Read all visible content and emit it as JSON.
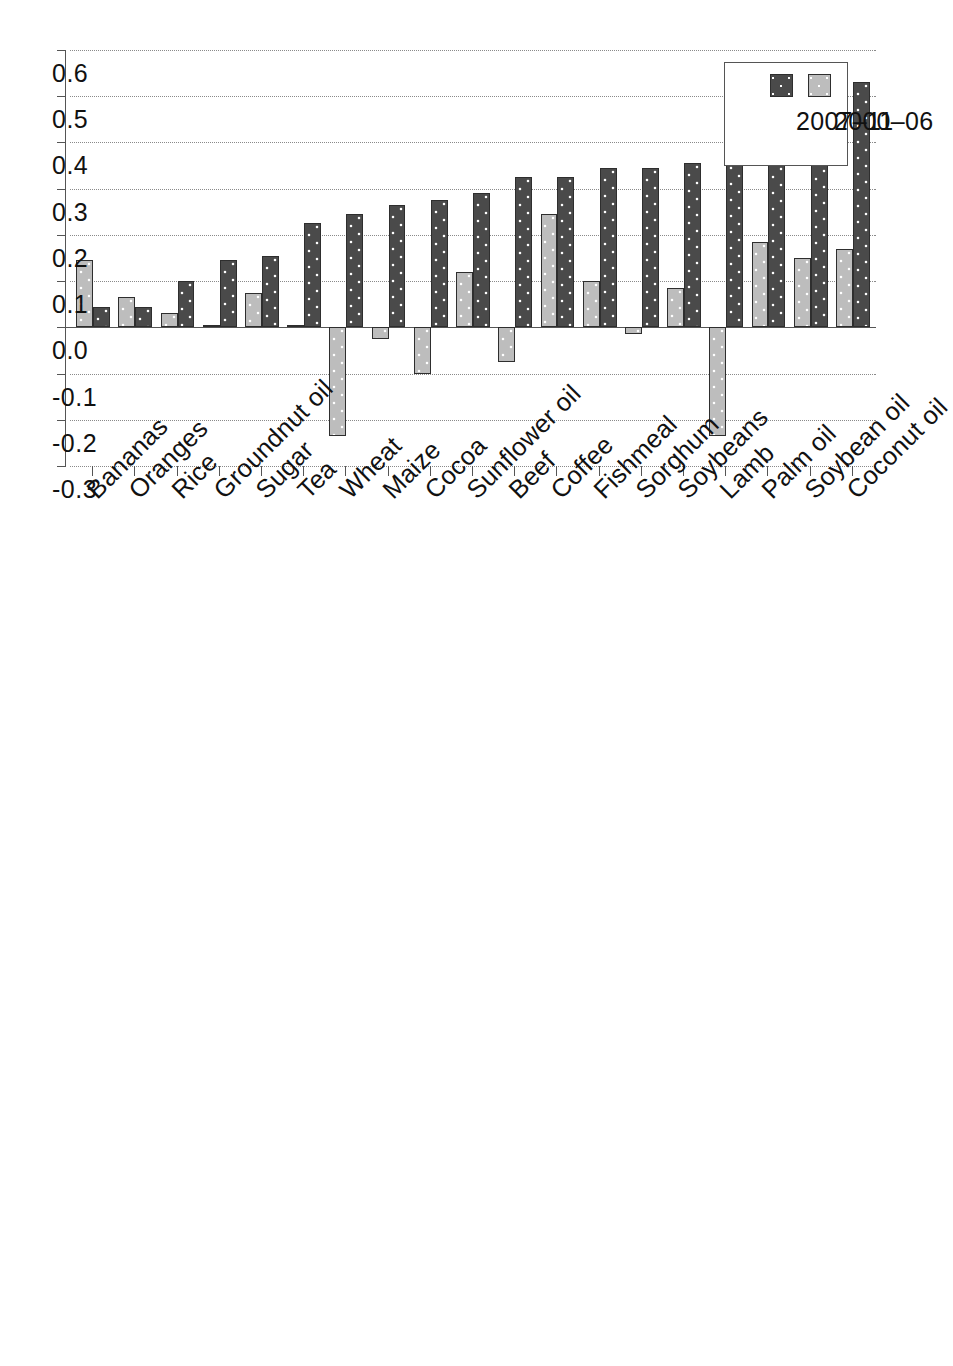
{
  "chart_data": {
    "type": "bar",
    "orientation": "horizontal-rotated",
    "title": "",
    "subtitle": "",
    "xlabel": "",
    "ylabel": "",
    "grid": true,
    "value_axis_range": [
      0.6,
      -0.3
    ],
    "value_axis_ticks": [
      "0.6",
      "0.5",
      "0.4",
      "0.3",
      "0.2",
      "0.1",
      "0.0",
      "-0.1",
      "-0.2",
      "-0.3"
    ],
    "value_axis_tick_values": [
      0.6,
      0.5,
      0.4,
      0.3,
      0.2,
      0.1,
      0.0,
      -0.1,
      -0.2,
      -0.3
    ],
    "legend_position": "top-left",
    "categories": [
      "Coconut oil",
      "Soybean oil",
      "Palm oil",
      "Lamb",
      "Soybeans",
      "Sorghum",
      "Fishmeal",
      "Coffee",
      "Beef",
      "Sunflower oil",
      "Cocoa",
      "Maize",
      "Wheat",
      "Tea",
      "Sugar",
      "Groundnut oil",
      "Rice",
      "Oranges",
      "Bananas"
    ],
    "series": [
      {
        "name": "2000–06",
        "color": "#bdbdbd",
        "values": [
          0.17,
          0.15,
          0.185,
          -0.235,
          0.085,
          -0.015,
          0.1,
          0.245,
          -0.075,
          0.12,
          -0.1,
          -0.025,
          -0.235,
          0.005,
          0.075,
          0.005,
          0.03,
          0.065,
          0.145
        ]
      },
      {
        "name": "2007–11",
        "color": "#4a4a4a",
        "values": [
          0.53,
          0.45,
          0.455,
          0.405,
          0.355,
          0.345,
          0.345,
          0.325,
          0.325,
          0.29,
          0.275,
          0.265,
          0.245,
          0.225,
          0.155,
          0.145,
          0.1,
          0.045,
          0.045
        ]
      }
    ]
  },
  "legend": {
    "entries": [
      {
        "label": "2000–06",
        "swatch": "period-a"
      },
      {
        "label": "2007–11",
        "swatch": "period-b"
      }
    ]
  },
  "colors": {
    "period_a": "#bdbdbd",
    "period_b": "#4a4a4a",
    "axis": "#555555",
    "grid": "#8a8a8a",
    "text": "#111111",
    "background": "#ffffff"
  }
}
